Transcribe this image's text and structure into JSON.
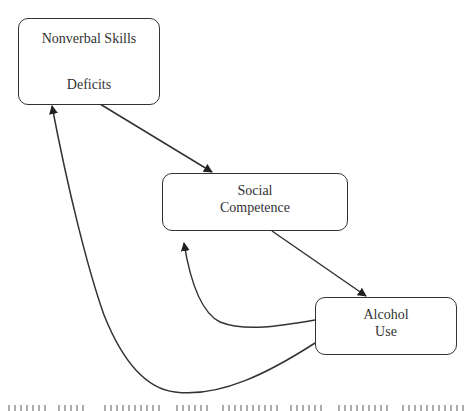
{
  "diagram": {
    "type": "flow-diagram",
    "nodes": [
      {
        "id": "nvsd",
        "lines": [
          "Nonverbal Skills",
          "Deficits"
        ]
      },
      {
        "id": "sc",
        "lines": [
          "Social",
          "Competence"
        ]
      },
      {
        "id": "au",
        "lines": [
          "Alcohol",
          "Use"
        ]
      }
    ],
    "edges": [
      {
        "from": "nvsd",
        "to": "sc",
        "style": "straight-arrow"
      },
      {
        "from": "sc",
        "to": "au",
        "style": "straight-arrow"
      },
      {
        "from": "au",
        "to": "sc",
        "style": "curved-arrow"
      },
      {
        "from": "au",
        "to": "nvsd",
        "style": "curved-arrow"
      }
    ],
    "colors": {
      "stroke": "#333333",
      "background": "#ffffff",
      "text": "#333333"
    }
  }
}
